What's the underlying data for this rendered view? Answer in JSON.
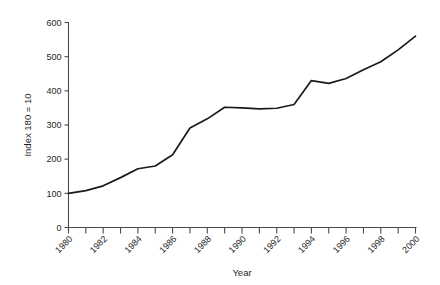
{
  "chart_data": {
    "type": "line",
    "title": "",
    "xlabel": "Year",
    "ylabel": "Index 180 = 10",
    "xlim": [
      1980,
      2000
    ],
    "ylim": [
      0,
      600
    ],
    "grid": false,
    "legend": false,
    "line_color": "#1a1a1a",
    "x": [
      1980,
      1981,
      1982,
      1983,
      1984,
      1985,
      1986,
      1987,
      1988,
      1989,
      1990,
      1991,
      1992,
      1993,
      1994,
      1995,
      1996,
      1997,
      1998,
      1999,
      2000
    ],
    "values": [
      100,
      108,
      122,
      146,
      172,
      180,
      213,
      291,
      318,
      352,
      350,
      347,
      349,
      360,
      430,
      422,
      436,
      462,
      485,
      520,
      560
    ],
    "series": [
      {
        "name": "Index",
        "values": [
          100,
          108,
          122,
          146,
          172,
          180,
          213,
          291,
          318,
          352,
          350,
          347,
          349,
          360,
          430,
          422,
          436,
          462,
          485,
          520,
          560
        ]
      }
    ],
    "x_tick_labels": [
      "1980",
      "1982",
      "1984",
      "1986",
      "1988",
      "1990",
      "1992",
      "1994",
      "1996",
      "1998",
      "2000"
    ],
    "x_tick_values": [
      1980,
      1982,
      1984,
      1986,
      1988,
      1990,
      1992,
      1994,
      1996,
      1998,
      2000
    ],
    "x_minor_ticks": [
      1981,
      1983,
      1985,
      1987,
      1989,
      1991,
      1993,
      1995,
      1997,
      1999
    ],
    "y_tick_labels": [
      "0",
      "100",
      "200",
      "300",
      "400",
      "500",
      "600"
    ],
    "y_tick_values": [
      0,
      100,
      200,
      300,
      400,
      500,
      600
    ],
    "x_tick_label_rotation": -45
  }
}
